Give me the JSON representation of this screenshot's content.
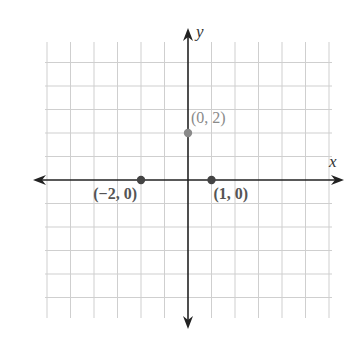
{
  "chart_data": {
    "type": "scatter",
    "title": "",
    "xlabel": "x",
    "ylabel": "y",
    "xlim": [
      -6,
      6
    ],
    "ylim": [
      -6,
      6
    ],
    "grid": true,
    "grid_step": 1,
    "axes_arrows": true,
    "points": [
      {
        "x": -2,
        "y": 0,
        "label": "(−2, 0)",
        "color": "#444444",
        "label_color": "#555555",
        "bold": true,
        "label_pos": "below-left"
      },
      {
        "x": 1,
        "y": 0,
        "label": "(1, 0)",
        "color": "#444444",
        "label_color": "#555555",
        "bold": true,
        "label_pos": "below-right"
      },
      {
        "x": 0,
        "y": 2,
        "label": "(0, 2)",
        "color": "#8a8a8a",
        "label_color": "#8a8a8a",
        "bold": false,
        "label_pos": "above-right"
      }
    ]
  },
  "layout": {
    "origin_px": [
      188,
      180
    ],
    "unit_px": 23.5,
    "grid_box": {
      "left": 45,
      "right": 332,
      "top": 42,
      "bottom": 318
    },
    "axis_ends": {
      "x_left": 33,
      "x_right": 344,
      "y_top": 28,
      "y_bottom": 329
    },
    "colors": {
      "grid": "#cfcfcf",
      "axis": "#222222"
    }
  }
}
